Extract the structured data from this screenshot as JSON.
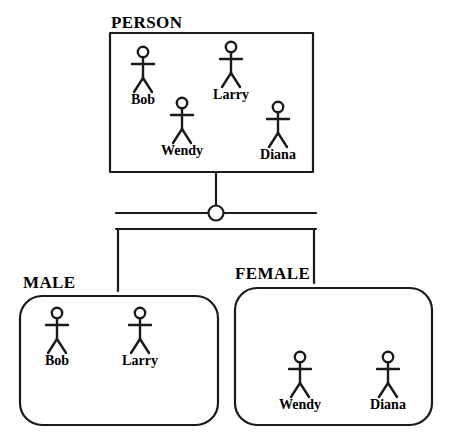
{
  "diagram": {
    "title_text": "",
    "stroke_color": "#1a1a1a",
    "background_color": "#ffffff",
    "superclass": {
      "label": "PERSON",
      "shape": "rectangle",
      "members": [
        {
          "name": "Bob",
          "cx": 143,
          "cy": 52
        },
        {
          "name": "Larry",
          "cx": 231,
          "cy": 47
        },
        {
          "name": "Wendy",
          "cx": 182,
          "cy": 103
        },
        {
          "name": "Diana",
          "cx": 278,
          "cy": 107
        }
      ]
    },
    "subclasses": [
      {
        "label": "MALE",
        "shape": "rounded-rectangle",
        "members": [
          {
            "name": "Bob",
            "cx": 57,
            "cy": 313
          },
          {
            "name": "Larry",
            "cx": 140,
            "cy": 313
          }
        ]
      },
      {
        "label": "FEMALE",
        "shape": "rounded-rectangle",
        "members": [
          {
            "name": "Wendy",
            "cx": 300,
            "cy": 357
          },
          {
            "name": "Diana",
            "cx": 388,
            "cy": 357
          }
        ]
      }
    ],
    "connector": {
      "type": "generalization-circle",
      "circle_label": ""
    }
  }
}
